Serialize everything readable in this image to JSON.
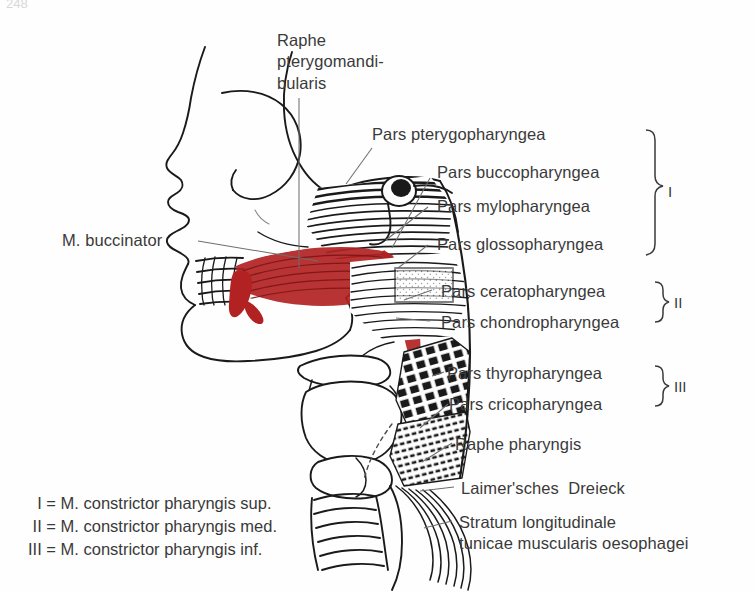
{
  "page": {
    "number": "248",
    "background_color": "#fefefe",
    "ink_color": "#1a1a1a",
    "text_color": "#3a3a3a",
    "accent_color": "#b22222",
    "leader_color": "#777777",
    "width": 755,
    "height": 593
  },
  "labels": {
    "raphe_pterygomandibularis": "Raphe\npterygomandi-\nbularis",
    "m_buccinator": "M. buccinator",
    "pars_pterygopharyngea": "Pars pterygopharyngea",
    "pars_buccopharyngea": "Pars buccopharyngea",
    "pars_mylopharyngea": "Pars mylopharyngea",
    "pars_glossopharyngea": "Pars glossopharyngea",
    "pars_ceratopharyngea": "Pars ceratopharyngea",
    "pars_chondropharyngea": "Pars chondropharyngea",
    "pars_thyropharyngea": "Pars thyropharyngea",
    "pars_cricopharyngea": "Pars cricopharyngea",
    "raphe_pharyngis": "Raphe pharyngis",
    "laimersches_dreieck": "Laimer'sches  Dreieck",
    "stratum_longitudinale": "Stratum longitudinale\ntunicae muscularis oesophagei"
  },
  "group_markers": {
    "one": "I",
    "two": "II",
    "three": "III"
  },
  "legend": {
    "rows": [
      "  I = M. constrictor pharyngis sup.",
      " II = M. constrictor pharyngis med.",
      "III = M. constrictor pharyngis inf."
    ],
    "row_1": "  I = M. constrictor pharyngis sup.",
    "row_2": " II = M. constrictor pharyngis med.",
    "row_3": "III = M. constrictor pharyngis inf."
  }
}
